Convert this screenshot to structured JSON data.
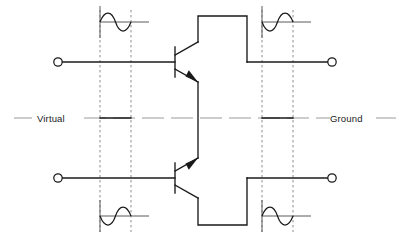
{
  "diagram": {
    "title_text_left": "Virtual",
    "title_text_right": "Ground",
    "colors": {
      "wire": "#1a1a1a",
      "dashed_reference": "#8c8c8c",
      "ground_axis": "#9a9a9a",
      "waveform": "#1a1a1a",
      "background": "#ffffff",
      "text": "#1a1a1a"
    },
    "geometry": {
      "width": 408,
      "height": 241,
      "virtual_ground_y": 118,
      "top_signal_y": 62,
      "bottom_signal_y": 178,
      "dashed_x": [
        100,
        131,
        262,
        293
      ],
      "terminal_radius": 4.2,
      "left_terminal_x": 58,
      "right_terminal_x": 332
    },
    "terminals": [
      {
        "name": "input-top",
        "x": 58,
        "y": 62
      },
      {
        "name": "input-bottom",
        "x": 58,
        "y": 178
      },
      {
        "name": "output-top",
        "x": 332,
        "y": 62
      },
      {
        "name": "output-bottom",
        "x": 332,
        "y": 178
      }
    ],
    "transistors": [
      {
        "name": "transistor-top",
        "type": "NPN",
        "base_x": 175,
        "base_y": 62,
        "orientation": "emitter-down"
      },
      {
        "name": "transistor-bottom",
        "type": "NPN",
        "base_x": 175,
        "base_y": 178,
        "orientation": "emitter-up"
      }
    ],
    "waveforms": [
      {
        "name": "waveform-top-left",
        "x": 100,
        "baseline_y": 22,
        "width": 46,
        "amplitude": 13,
        "phase": "positive-first",
        "axis_extra": 18
      },
      {
        "name": "waveform-top-right",
        "x": 262,
        "baseline_y": 22,
        "width": 46,
        "amplitude": 13,
        "phase": "negative-first",
        "axis_extra": 18
      },
      {
        "name": "waveform-bottom-left",
        "x": 100,
        "baseline_y": 216,
        "width": 46,
        "amplitude": 13,
        "phase": "negative-first",
        "axis_extra": 18
      },
      {
        "name": "waveform-bottom-right",
        "x": 262,
        "baseline_y": 216,
        "width": 46,
        "amplitude": 13,
        "phase": "positive-first",
        "axis_extra": 18
      }
    ]
  }
}
